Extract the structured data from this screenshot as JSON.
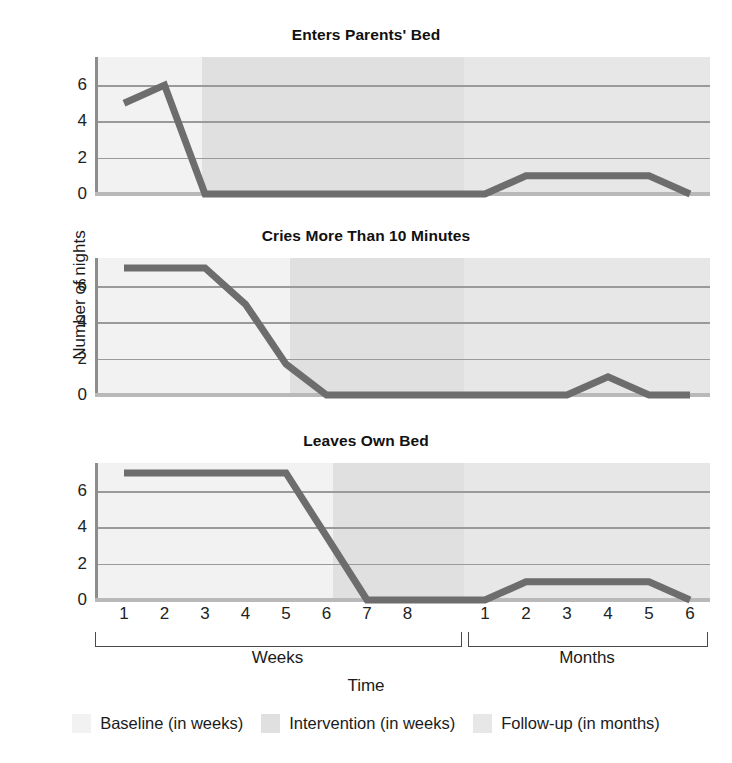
{
  "figure": {
    "axis_title": "Time",
    "ylabel": "Number of nights",
    "groups": [
      {
        "key": "weeks",
        "label": "Weeks"
      },
      {
        "key": "months",
        "label": "Months"
      }
    ],
    "week_ticks": [
      "1",
      "2",
      "3",
      "4",
      "5",
      "6",
      "7",
      "8"
    ],
    "month_ticks": [
      "1",
      "2",
      "3",
      "4",
      "5",
      "6"
    ],
    "yticks": [
      "0",
      "2",
      "4",
      "6"
    ]
  },
  "legend": {
    "items": [
      {
        "label": "Baseline (in weeks)",
        "color": "#f2f2f2"
      },
      {
        "label": "Intervention (in weeks)",
        "color": "#e0e0e0"
      },
      {
        "label": "Follow-up (in months)",
        "color": "#e7e7e7"
      }
    ]
  },
  "colors": {
    "line": "#6d6d6d",
    "gridline": "#9a9a9a",
    "axis": "#8d8d8d",
    "baseline_band": "#f2f2f2",
    "intervention_band": "#e0e0e0",
    "followup_band": "#e7e7e7"
  },
  "chart_data": [
    {
      "type": "line",
      "title": "Enters Parents' Bed",
      "xlabel": "Time",
      "ylabel": "Number of nights",
      "ylim": [
        0,
        7
      ],
      "yticks": [
        0,
        2,
        4,
        6
      ],
      "grid": true,
      "legend_position": "bottom",
      "phase_change_after": "week 2",
      "x": [
        "W1",
        "W2",
        "W3",
        "W4",
        "W5",
        "W6",
        "W7",
        "W8",
        "M1",
        "M2",
        "M3",
        "M4",
        "M5",
        "M6"
      ],
      "categories": [
        "Week 1",
        "Week 2",
        "Week 3",
        "Week 4",
        "Week 5",
        "Week 6",
        "Week 7",
        "Week 8",
        "Month 1",
        "Month 2",
        "Month 3",
        "Month 4",
        "Month 5",
        "Month 6"
      ],
      "values": [
        5,
        6,
        0,
        0,
        0,
        0,
        0,
        0,
        0,
        1,
        1,
        1,
        1,
        0
      ]
    },
    {
      "type": "line",
      "title": "Cries More Than 10 Minutes",
      "xlabel": "Time",
      "ylabel": "Number of nights",
      "ylim": [
        0,
        7
      ],
      "yticks": [
        0,
        2,
        4,
        6
      ],
      "grid": true,
      "legend_position": "bottom",
      "phase_change_after": "week 4",
      "x": [
        "W1",
        "W2",
        "W3",
        "W4",
        "W5",
        "W6",
        "W7",
        "W8",
        "M1",
        "M2",
        "M3",
        "M4",
        "M5",
        "M6"
      ],
      "categories": [
        "Week 1",
        "Week 2",
        "Week 3",
        "Week 4",
        "Week 5",
        "Week 6",
        "Week 7",
        "Week 8",
        "Month 1",
        "Month 2",
        "Month 3",
        "Month 4",
        "Month 5",
        "Month 6"
      ],
      "values": [
        7,
        7,
        7,
        5,
        1.7,
        0,
        0,
        0,
        0,
        0,
        0,
        1,
        0,
        0
      ]
    },
    {
      "type": "line",
      "title": "Leaves Own Bed",
      "xlabel": "Time",
      "ylabel": "Number of nights",
      "ylim": [
        0,
        7
      ],
      "yticks": [
        0,
        2,
        4,
        6
      ],
      "grid": true,
      "legend_position": "bottom",
      "phase_change_after": "week 5",
      "x": [
        "W1",
        "W2",
        "W3",
        "W4",
        "W5",
        "W6",
        "W7",
        "W8",
        "M1",
        "M2",
        "M3",
        "M4",
        "M5",
        "M6"
      ],
      "categories": [
        "Week 1",
        "Week 2",
        "Week 3",
        "Week 4",
        "Week 5",
        "Week 6",
        "Week 7",
        "Week 8",
        "Month 1",
        "Month 2",
        "Month 3",
        "Month 4",
        "Month 5",
        "Month 6"
      ],
      "values": [
        7,
        7,
        7,
        7,
        7,
        3.5,
        0,
        0,
        0,
        1,
        1,
        1,
        1,
        0
      ]
    }
  ]
}
